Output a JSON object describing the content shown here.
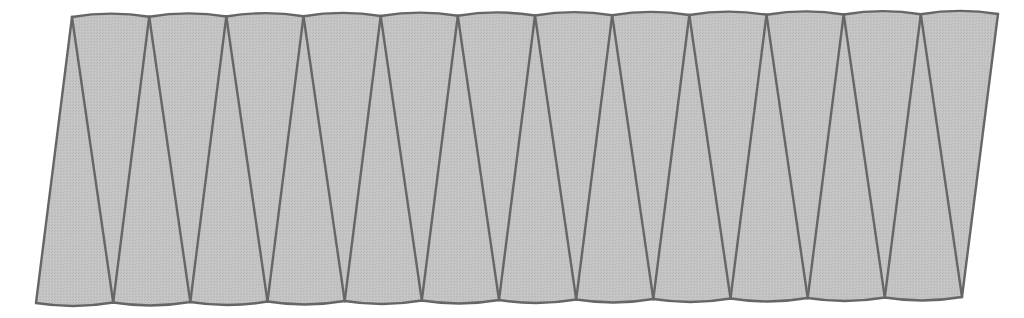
{
  "diagram": {
    "type": "zigzag-triangulated-strip",
    "segments": 12,
    "colors": {
      "fill": "#c2c2c2",
      "stroke": "#666666",
      "background": "#ffffff"
    },
    "stroke_width": 2.4,
    "arc_bulge": 3.2,
    "top_vertices": [
      [
        72,
        17.0
      ],
      [
        149.2,
        16.75
      ],
      [
        226.3,
        16.5
      ],
      [
        303.5,
        16.25
      ],
      [
        380.7,
        16.0
      ],
      [
        457.8,
        15.75
      ],
      [
        535,
        15.5
      ],
      [
        612.2,
        15.25
      ],
      [
        689.3,
        15.0
      ],
      [
        766.5,
        14.75
      ],
      [
        843.7,
        14.5
      ],
      [
        920.8,
        14.25
      ],
      [
        998,
        14.0
      ]
    ],
    "bottom_vertices": [
      [
        36,
        303.0
      ],
      [
        113.2,
        302.5
      ],
      [
        190.3,
        302.0
      ],
      [
        267.5,
        301.5
      ],
      [
        344.7,
        301.0
      ],
      [
        421.8,
        300.5
      ],
      [
        499,
        300.0
      ],
      [
        576.2,
        299.5
      ],
      [
        653.3,
        299.0
      ],
      [
        730.5,
        298.5
      ],
      [
        807.7,
        298.0
      ],
      [
        884.8,
        297.5
      ],
      [
        962,
        297.0
      ]
    ]
  }
}
